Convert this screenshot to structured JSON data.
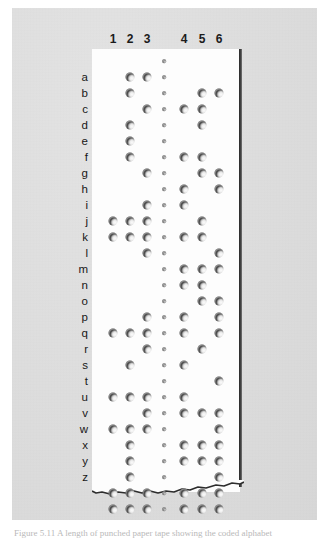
{
  "figure": {
    "media": "photograph",
    "background_color": "#dcdcdc",
    "tape_color": "#fdfdfd",
    "tape_edge_color": "#2a2a2a",
    "hole_color": "#141414"
  },
  "columns": {
    "labels": [
      "1",
      "2",
      "3",
      "4",
      "5",
      "6"
    ],
    "x_positions": [
      21,
      38,
      55,
      92,
      110,
      127
    ],
    "sprocket_x": 72,
    "note": "six data tracks with a sprocket-hole track between tracks 3 and 4"
  },
  "rows": {
    "labels": [
      "a",
      "b",
      "c",
      "d",
      "e",
      "f",
      "g",
      "h",
      "i",
      "j",
      "k",
      "l",
      "m",
      "n",
      "o",
      "p",
      "q",
      "r",
      "s",
      "t",
      "u",
      "v",
      "w",
      "x",
      "y",
      "z"
    ],
    "count": 26
  },
  "caption": {
    "text": "Figure 5.11  A length of punched paper tape showing the coded alphabet"
  },
  "chart_data": {
    "type": "table",
    "xlabel": "Track number",
    "ylabel": "Letter",
    "categories": [
      "1",
      "2",
      "3",
      "4",
      "5",
      "6"
    ],
    "rows": [
      {
        "letter": "",
        "tracks": []
      },
      {
        "letter": "a",
        "tracks": [
          2,
          3
        ]
      },
      {
        "letter": "b",
        "tracks": [
          2,
          5,
          6
        ]
      },
      {
        "letter": "c",
        "tracks": [
          3,
          4,
          5
        ]
      },
      {
        "letter": "d",
        "tracks": [
          2,
          5
        ]
      },
      {
        "letter": "e",
        "tracks": [
          2
        ]
      },
      {
        "letter": "f",
        "tracks": [
          2,
          4,
          5
        ]
      },
      {
        "letter": "g",
        "tracks": [
          3,
          5,
          6
        ]
      },
      {
        "letter": "h",
        "tracks": [
          4,
          6
        ]
      },
      {
        "letter": "i",
        "tracks": [
          3,
          4
        ]
      },
      {
        "letter": "j",
        "tracks": [
          1,
          2,
          3,
          5
        ]
      },
      {
        "letter": "k",
        "tracks": [
          1,
          2,
          3,
          4,
          5
        ]
      },
      {
        "letter": "l",
        "tracks": [
          3,
          6
        ]
      },
      {
        "letter": "m",
        "tracks": [
          4,
          5,
          6
        ]
      },
      {
        "letter": "n",
        "tracks": [
          4,
          5
        ]
      },
      {
        "letter": "o",
        "tracks": [
          5,
          6
        ]
      },
      {
        "letter": "p",
        "tracks": [
          3,
          4,
          6
        ]
      },
      {
        "letter": "q",
        "tracks": [
          1,
          2,
          3,
          4,
          6
        ]
      },
      {
        "letter": "r",
        "tracks": [
          3,
          5
        ]
      },
      {
        "letter": "s",
        "tracks": [
          2,
          4
        ]
      },
      {
        "letter": "t",
        "tracks": [
          6
        ]
      },
      {
        "letter": "u",
        "tracks": [
          1,
          2,
          3,
          4
        ]
      },
      {
        "letter": "v",
        "tracks": [
          3,
          4,
          5,
          6
        ]
      },
      {
        "letter": "w",
        "tracks": [
          1,
          2,
          3,
          6
        ]
      },
      {
        "letter": "x",
        "tracks": [
          2,
          4,
          5,
          6
        ]
      },
      {
        "letter": "y",
        "tracks": [
          2,
          4,
          5,
          6
        ]
      },
      {
        "letter": "z",
        "tracks": [
          2,
          6
        ]
      },
      {
        "letter": "",
        "tracks": [
          1,
          2,
          3,
          4,
          5,
          6
        ]
      },
      {
        "letter": "",
        "tracks": [
          1,
          2,
          3,
          4,
          5,
          6
        ]
      }
    ],
    "grid": false,
    "legend": "none"
  }
}
